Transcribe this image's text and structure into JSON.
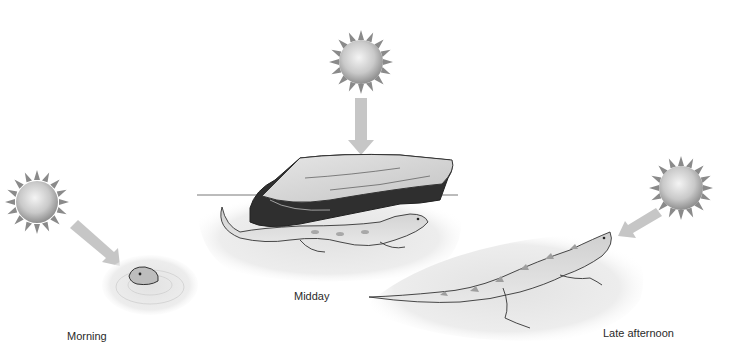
{
  "figure": {
    "topic": "Lizard behavioral thermoregulation over the day",
    "palette": {
      "background": "#ffffff",
      "sun_core": "#e8e8e8",
      "sun_edge": "#9a9a9a",
      "arrow": "#c8c8c8",
      "sand": "#ececec",
      "lizard_body": "#d4d4d4",
      "lizard_spots": "#9a9a9a",
      "rock_top": "#dadada",
      "rock_side": "#3a3a3a"
    },
    "panels": [
      {
        "id": "morning",
        "label": "Morning",
        "sun_icon": "sun-icon",
        "arrow_direction": "down-right",
        "scene": "lizard head emerging from burrow in sand"
      },
      {
        "id": "midday",
        "label": "Midday",
        "sun_icon": "sun-icon",
        "arrow_direction": "down",
        "scene": "lizard sheltering beneath flat rock"
      },
      {
        "id": "late_afternoon",
        "label": "Late afternoon",
        "sun_icon": "sun-icon",
        "arrow_direction": "down-left",
        "scene": "lizard basking on open sand"
      }
    ]
  }
}
